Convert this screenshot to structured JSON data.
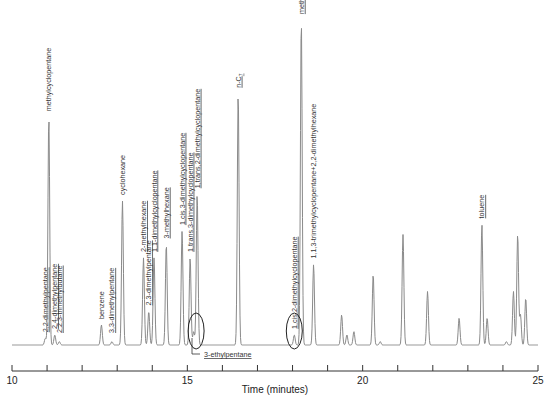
{
  "chart_data": {
    "type": "line",
    "title": "",
    "xlabel": "Time (minutes)",
    "ylabel": "",
    "xlim": [
      10,
      25
    ],
    "x_ticks": [
      10,
      11,
      12,
      13,
      14,
      15,
      16,
      17,
      18,
      19,
      20,
      21,
      22,
      23,
      24,
      25
    ],
    "x_tick_labels": [
      "10",
      "15",
      "20",
      "25"
    ],
    "grid": false,
    "legend": null,
    "baseline_level": 0,
    "y_units": "relative detector response (0-100)",
    "peaks": [
      {
        "t": 10.95,
        "h": 2,
        "label": "2,2-dimethylpentane",
        "underline": true
      },
      {
        "t": 11.05,
        "h": 68,
        "label": "methylcyclopentane",
        "underline": false
      },
      {
        "t": 11.22,
        "h": 3,
        "label": "2,4-dimethylpentane",
        "underline": true
      },
      {
        "t": 11.35,
        "h": 1,
        "label": "2,2,3-trimethylbutane",
        "underline": true
      },
      {
        "t": 12.55,
        "h": 6,
        "label": "benzene",
        "underline": false
      },
      {
        "t": 12.85,
        "h": 1,
        "label": "3,3-dimethylpentane",
        "underline": true
      },
      {
        "t": 13.15,
        "h": 43,
        "label": "cyclohexane",
        "underline": false
      },
      {
        "t": 13.75,
        "h": 26,
        "label": "2-methylhexane",
        "underline": true
      },
      {
        "t": 13.9,
        "h": 10,
        "label": "2,3-dimethylpentane",
        "underline": true
      },
      {
        "t": 14.05,
        "h": 26,
        "label": "1,1-dimethylcyclopentane",
        "underline": true
      },
      {
        "t": 14.4,
        "h": 30,
        "label": "3-methylhexane",
        "underline": true
      },
      {
        "t": 14.85,
        "h": 34,
        "label": "1,cis,3-dimethylcyclopentane",
        "underline": true
      },
      {
        "t": 15.08,
        "h": 26,
        "label": "1,trans,3-dimethylcyclopentane",
        "underline": true
      },
      {
        "t": 15.18,
        "h": 4,
        "label": "3-ethylpentane",
        "underline": true,
        "circled": true
      },
      {
        "t": 15.28,
        "h": 45,
        "label": "1,trans,2-dimethylcyclopentane",
        "underline": true
      },
      {
        "t": 16.45,
        "h": 75,
        "label": "n-C7",
        "underline": true
      },
      {
        "t": 18.05,
        "h": 3,
        "label": "1,cis,2-dimethylcyclopentane",
        "underline": true,
        "circled": true
      },
      {
        "t": 18.25,
        "h": 97,
        "label": "methylcyclohexane",
        "underline": true
      },
      {
        "t": 18.6,
        "h": 24,
        "label": "1,1,3-trimethylcyclopentane+2,2-dimethylhexane",
        "underline": false
      },
      {
        "t": 19.4,
        "h": 9,
        "label": ""
      },
      {
        "t": 19.55,
        "h": 3,
        "label": ""
      },
      {
        "t": 19.75,
        "h": 4,
        "label": ""
      },
      {
        "t": 20.3,
        "h": 21,
        "label": ""
      },
      {
        "t": 20.5,
        "h": 1,
        "label": ""
      },
      {
        "t": 21.15,
        "h": 33,
        "label": ""
      },
      {
        "t": 21.85,
        "h": 16,
        "label": ""
      },
      {
        "t": 22.75,
        "h": 8,
        "label": ""
      },
      {
        "t": 23.4,
        "h": 36,
        "label": "toluene",
        "underline": true
      },
      {
        "t": 23.55,
        "h": 8,
        "label": ""
      },
      {
        "t": 24.1,
        "h": 1,
        "label": ""
      },
      {
        "t": 24.3,
        "h": 16,
        "label": ""
      },
      {
        "t": 24.42,
        "h": 33,
        "label": ""
      },
      {
        "t": 24.5,
        "h": 9,
        "label": ""
      },
      {
        "t": 24.65,
        "h": 14,
        "label": ""
      }
    ],
    "annotations": [
      {
        "type": "ellipse",
        "t": 15.25,
        "note": "circled 3-ethylpentane region"
      },
      {
        "type": "ellipse",
        "t": 18.05,
        "note": "circled 1,cis,2-dimethylcyclopentane region"
      }
    ]
  },
  "labels": {
    "x_axis_title": "Time (minutes)",
    "ethylpentane_callout": "3-ethylpentane"
  }
}
